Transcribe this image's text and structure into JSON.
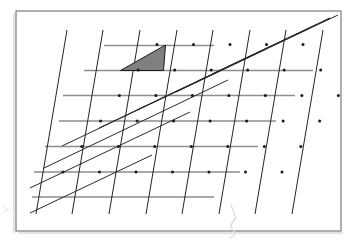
{
  "figure": {
    "caption": "",
    "background_color": "#ffffff",
    "frame": {
      "name": "figure-border",
      "x": 16,
      "y": 11,
      "width": 325,
      "height": 220,
      "stroke_color": "#6e6e6e",
      "stroke_width": 1.1
    },
    "colors": {
      "paper": "#ffffff",
      "frame": "#6e6e6e",
      "frame_shadow": "#c9c9c9",
      "horizontal_lines": "#8d8d8d",
      "steep_lines": "#232323",
      "shallow_lines": "#2a2a2a",
      "shaded_triangle_fill": "#7f7f7f",
      "shaded_triangle_stroke": "#1a1a1a",
      "lattice_node": "#1a1a1a",
      "smudge": "#d8d8d8"
    },
    "lattice": {
      "description": "Oblique lattice generated by two basis vectors, drawn with three families of straight lines",
      "origin": {
        "x": 63,
        "y": 172
      },
      "basis_vector_a": {
        "dx": 36.5,
        "dy": 0
      },
      "basis_vector_b": {
        "dx": 18.8,
        "dy": -25.5
      },
      "columns": 7,
      "rows": 6,
      "line_families": [
        {
          "name": "horizontal",
          "label": "family-a",
          "count": 6,
          "color": "#8d8d8d",
          "stroke_width": 1.5
        },
        {
          "name": "steep-diagonal",
          "label": "family-b",
          "count": 12,
          "color": "#232323",
          "stroke_width": 1.0
        },
        {
          "name": "shallow-diagonal",
          "label": "family-c",
          "count": 12,
          "color": "#2a2a2a",
          "stroke_width": 1.0
        }
      ]
    },
    "horizontal_lines": [
      {
        "y": 45.5,
        "x1": 104,
        "x2": 214
      },
      {
        "y": 70.5,
        "x1": 84,
        "x2": 313
      },
      {
        "y": 95.5,
        "x1": 63,
        "x2": 295
      },
      {
        "y": 121.0,
        "x1": 59,
        "x2": 276
      },
      {
        "y": 146.5,
        "x1": 45,
        "x2": 258
      },
      {
        "y": 172.0,
        "x1": 34,
        "x2": 240
      },
      {
        "y": 197.0,
        "x1": 32,
        "x2": 214
      }
    ],
    "steep_lines": [
      {
        "x1": 109,
        "y1": 214,
        "x2": 140,
        "y2": 30
      },
      {
        "x1": 146,
        "y1": 214,
        "x2": 177,
        "y2": 30
      },
      {
        "x1": 182,
        "y1": 214,
        "x2": 213,
        "y2": 30
      },
      {
        "x1": 219,
        "y1": 214,
        "x2": 250,
        "y2": 30
      },
      {
        "x1": 255,
        "y1": 214,
        "x2": 286,
        "y2": 30
      },
      {
        "x1": 292,
        "y1": 214,
        "x2": 323,
        "y2": 30
      },
      {
        "x1": 72,
        "y1": 214,
        "x2": 103,
        "y2": 30
      },
      {
        "x1": 36,
        "y1": 214,
        "x2": 67,
        "y2": 30
      }
    ],
    "shallow_lines": [
      {
        "x1": 30,
        "y1": 213,
        "x2": 152,
        "y2": 155
      },
      {
        "x1": 30,
        "y1": 188,
        "x2": 190,
        "y2": 112
      },
      {
        "x1": 44,
        "y1": 168,
        "x2": 228,
        "y2": 80
      },
      {
        "x1": 62,
        "y1": 146,
        "x2": 266,
        "y2": 49
      },
      {
        "x1": 99,
        "y1": 128,
        "x2": 303,
        "y2": 31
      },
      {
        "x1": 137,
        "y1": 110,
        "x2": 330,
        "y2": 18
      },
      {
        "x1": 176,
        "y1": 92,
        "x2": 338,
        "y2": 15
      },
      {
        "x1": 212,
        "y1": 74,
        "x2": 330,
        "y2": 18
      }
    ],
    "shaded_triangle": {
      "name": "fundamental-domain",
      "vertices": [
        {
          "x": 120.5,
          "y": 70.5
        },
        {
          "x": 163.5,
          "y": 70.5
        },
        {
          "x": 165.5,
          "y": 45.0
        }
      ],
      "fill": "#7f7f7f",
      "stroke": "#1a1a1a"
    },
    "artifacts": [
      {
        "name": "pencil-smudge-bottom",
        "path": "M 231 205 L 236 218 M 236 218 Q 228 226 233 230 Q 238 234 230 238"
      },
      {
        "name": "pencil-smudge-left",
        "path": "M 2 206 L 9 211 M 3 213 L 8 209"
      }
    ]
  }
}
